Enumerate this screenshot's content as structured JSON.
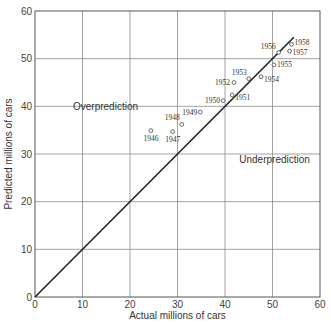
{
  "chart_data": {
    "type": "scatter",
    "title": "",
    "xlabel": "Actual millions of cars",
    "ylabel": "Predicted millions of cars",
    "xlim": [
      0,
      60
    ],
    "ylim": [
      0,
      60
    ],
    "xticks": [
      0,
      10,
      20,
      30,
      40,
      50,
      60
    ],
    "yticks": [
      0,
      10,
      20,
      30,
      40,
      50,
      60
    ],
    "grid": true,
    "legend": null,
    "annotations": [
      {
        "text": "Overprediction",
        "x": 8,
        "y": 40
      },
      {
        "text": "Underprediction",
        "x": 43,
        "y": 29
      }
    ],
    "reference_line": {
      "label": "perfect prediction (y = x)",
      "from": [
        0,
        0
      ],
      "to": [
        54.5,
        54.5
      ]
    },
    "series": [
      {
        "name": "Automobiles",
        "points": [
          {
            "label": "1946",
            "x": 24.4,
            "y": 34.9
          },
          {
            "label": "1947",
            "x": 29.0,
            "y": 34.7
          },
          {
            "label": "1948",
            "x": 30.9,
            "y": 36.2
          },
          {
            "label": "1949",
            "x": 34.8,
            "y": 38.8
          },
          {
            "label": "1950",
            "x": 39.6,
            "y": 41.2
          },
          {
            "label": "1951",
            "x": 41.5,
            "y": 42.4
          },
          {
            "label": "1952",
            "x": 41.9,
            "y": 45.0
          },
          {
            "label": "1953",
            "x": 45.0,
            "y": 45.8
          },
          {
            "label": "1954",
            "x": 47.6,
            "y": 46.2
          },
          {
            "label": "1955",
            "x": 50.3,
            "y": 48.7
          },
          {
            "label": "1956",
            "x": 51.3,
            "y": 51.3
          },
          {
            "label": "1957",
            "x": 53.6,
            "y": 51.6
          },
          {
            "label": "1958",
            "x": 54.0,
            "y": 53.0
          }
        ]
      }
    ]
  },
  "colors": {
    "axis": "#555555",
    "grid": "#8a8a8a",
    "line": "#222222",
    "marker": "#444444"
  }
}
